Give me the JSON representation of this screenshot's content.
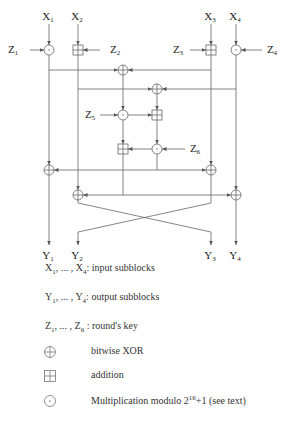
{
  "diagram": {
    "inputs": [
      {
        "base": "X",
        "sub": "1"
      },
      {
        "base": "X",
        "sub": "2"
      },
      {
        "base": "X",
        "sub": "3"
      },
      {
        "base": "X",
        "sub": "4"
      }
    ],
    "outputs": [
      {
        "base": "Y",
        "sub": "1"
      },
      {
        "base": "Y",
        "sub": "2"
      },
      {
        "base": "Y",
        "sub": "3"
      },
      {
        "base": "Y",
        "sub": "4"
      }
    ],
    "keys": [
      {
        "base": "Z",
        "sub": "1"
      },
      {
        "base": "Z",
        "sub": "2"
      },
      {
        "base": "Z",
        "sub": "3"
      },
      {
        "base": "Z",
        "sub": "4"
      },
      {
        "base": "Z",
        "sub": "5"
      },
      {
        "base": "Z",
        "sub": "6"
      }
    ],
    "operations": {
      "mul": "multiplication modulo 2^16+1",
      "add": "addition",
      "xor": "bitwise XOR"
    }
  },
  "legend": {
    "inputs": {
      "a": "X",
      "a_sub": "1",
      "mid": ", ... , ",
      "b": "X",
      "b_sub": "4",
      "text": ": input subblocks"
    },
    "outputs": {
      "a": "Y",
      "a_sub": "1",
      "mid": ", ... , ",
      "b": "Y",
      "b_sub": "4",
      "text": ": output subblocks"
    },
    "keys": {
      "a": "Z",
      "a_sub": "1",
      "mid": ", ... , ",
      "b": "Z",
      "b_sub": "6",
      "text": " : round's key"
    },
    "xor_label": "bitwise XOR",
    "add_label": "addition",
    "mul_label_pre": "Multiplication modulo 2",
    "mul_label_sup": "16",
    "mul_label_post": "+1 (see text)"
  }
}
